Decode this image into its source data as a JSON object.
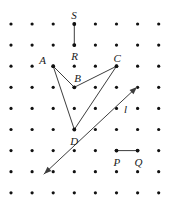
{
  "diagram": {
    "kind": "geoboard-dot-grid-geometry",
    "background_color": "#ffffff",
    "ink_color": "#3d3d3d",
    "dot_color": "#111111",
    "label_color": "#1a1a1a",
    "grid": {
      "columns": 9,
      "rows": 9,
      "origin_x": 11,
      "origin_y": 24,
      "spacing_x": 21.1,
      "spacing_y": 21.1,
      "dot_radius": 1.6
    },
    "points": [
      {
        "name": "S",
        "grid_col": 3,
        "grid_row": 0,
        "label_dx": -3,
        "label_dy": -14
      },
      {
        "name": "R",
        "grid_col": 3,
        "grid_row": 1,
        "label_dx": -3,
        "label_dy": 6
      },
      {
        "name": "A",
        "grid_col": 2,
        "grid_row": 2,
        "label_dx": -14,
        "label_dy": -11
      },
      {
        "name": "B",
        "grid_col": 3,
        "grid_row": 3,
        "label_dx": 0,
        "label_dy": -14
      },
      {
        "name": "C",
        "grid_col": 5,
        "grid_row": 2,
        "label_dx": -3,
        "label_dy": -13
      },
      {
        "name": "D",
        "grid_col": 3,
        "grid_row": 5,
        "label_dx": -4,
        "label_dy": 6
      },
      {
        "name": "P",
        "grid_col": 5,
        "grid_row": 6,
        "label_dx": -3,
        "label_dy": 6
      },
      {
        "name": "Q",
        "grid_col": 6,
        "grid_row": 6,
        "label_dx": -3,
        "label_dy": 6
      }
    ],
    "segments": [
      {
        "name": "segment-SR",
        "from": "S",
        "to": "R",
        "arrow_start": false,
        "arrow_end": false
      },
      {
        "name": "segment-AB",
        "from": "A",
        "to": "B",
        "arrow_start": false,
        "arrow_end": false
      },
      {
        "name": "segment-BC",
        "from": "B",
        "to": "C",
        "arrow_start": false,
        "arrow_end": false
      },
      {
        "name": "segment-AD",
        "from": "A",
        "to": "D",
        "arrow_start": false,
        "arrow_end": false
      },
      {
        "name": "segment-DC",
        "from": "D",
        "to": "C",
        "arrow_start": false,
        "arrow_end": false
      },
      {
        "name": "segment-PQ",
        "from": "P",
        "to": "Q",
        "arrow_start": false,
        "arrow_end": false
      }
    ],
    "lines": [
      {
        "name": "line-l",
        "label": "l",
        "x1": 44,
        "y1": 174,
        "x2": 137,
        "y2": 87,
        "arrow_start": true,
        "arrow_end": true,
        "label_x": 124,
        "label_y": 104
      }
    ],
    "labels_style": {
      "font_style": "italic",
      "font_size_px": 11
    }
  }
}
